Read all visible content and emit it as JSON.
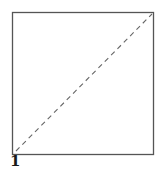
{
  "diagram": {
    "type": "origami-fold-step",
    "step_number": "1",
    "paper": {
      "shape": "square",
      "x1": 12,
      "y1": 12,
      "x2": 153,
      "y2": 155,
      "stroke": "#555555"
    },
    "fold_line": {
      "style": "dashed",
      "type": "valley-fold",
      "from": "bottom-left",
      "to": "top-right",
      "stroke": "#666666"
    }
  }
}
